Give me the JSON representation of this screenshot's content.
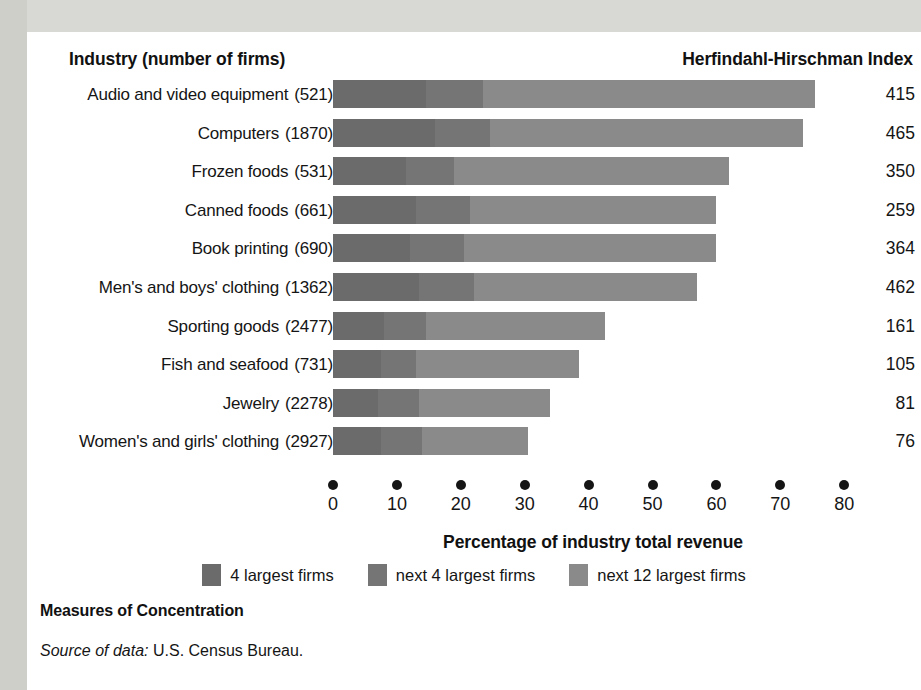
{
  "headers": {
    "industry": "Industry (number of firms)",
    "hhi": "Herfindahl-Hirschman Index"
  },
  "axis_title": "Percentage of industry total revenue",
  "figure_caption": "Measures of Concentration",
  "source": {
    "label": "Source of data:",
    "text": "U.S. Census Bureau."
  },
  "legend": [
    {
      "key": "s1",
      "label": "4 largest firms",
      "color": "#6b6b6b"
    },
    {
      "key": "s2",
      "label": "next 4 largest firms",
      "color": "#757575"
    },
    {
      "key": "s3",
      "label": "next 12 largest firms",
      "color": "#8a8a8a"
    }
  ],
  "ticks": [
    {
      "label": "0",
      "value": 0
    },
    {
      "label": "10",
      "value": 10
    },
    {
      "label": "20",
      "value": 20
    },
    {
      "label": "30",
      "value": 30
    },
    {
      "label": "40",
      "value": 40
    },
    {
      "label": "50",
      "value": 50
    },
    {
      "label": "60",
      "value": 60
    },
    {
      "label": "70",
      "value": 70
    },
    {
      "label": "80",
      "value": 80
    }
  ],
  "chart_data": {
    "type": "bar",
    "orientation": "horizontal",
    "stacked": true,
    "title": "Measures of Concentration",
    "xlabel": "Percentage of industry total revenue",
    "ylabel": "Industry (number of firms)",
    "xlim": [
      0,
      80
    ],
    "grid": false,
    "legend_position": "bottom-center",
    "series": [
      {
        "name": "4 largest firms",
        "color": "#6b6b6b",
        "values": [
          14.5,
          16.0,
          11.5,
          13.0,
          12.0,
          13.5,
          8.0,
          7.5,
          7.0,
          7.5
        ]
      },
      {
        "name": "next 4 largest firms",
        "color": "#757575",
        "values": [
          9.0,
          8.5,
          7.5,
          8.5,
          8.5,
          8.5,
          6.5,
          5.5,
          6.5,
          6.5
        ]
      },
      {
        "name": "next 12 largest firms",
        "color": "#8a8a8a",
        "values": [
          52.0,
          49.0,
          43.0,
          38.5,
          39.5,
          35.0,
          28.0,
          25.5,
          20.5,
          16.5
        ]
      }
    ],
    "categories": [
      "Audio and video equipment",
      "Computers",
      "Frozen foods",
      "Canned foods",
      "Book printing",
      "Men's and boys' clothing",
      "Sporting goods",
      "Fish and seafood",
      "Jewelry",
      "Women's and girls' clothing"
    ],
    "rows": [
      {
        "industry": "Audio and video equipment",
        "firms": "(521)",
        "seg1": 14.5,
        "seg2": 9.0,
        "seg3": 52.0,
        "total": 75.5,
        "hhi": "415"
      },
      {
        "industry": "Computers",
        "firms": "(1870)",
        "seg1": 16.0,
        "seg2": 8.5,
        "seg3": 49.0,
        "total": 73.5,
        "hhi": "465"
      },
      {
        "industry": "Frozen foods",
        "firms": "(531)",
        "seg1": 11.5,
        "seg2": 7.5,
        "seg3": 43.0,
        "total": 62.0,
        "hhi": "350"
      },
      {
        "industry": "Canned foods",
        "firms": "(661)",
        "seg1": 13.0,
        "seg2": 8.5,
        "seg3": 38.5,
        "total": 60.0,
        "hhi": "259"
      },
      {
        "industry": "Book printing",
        "firms": "(690)",
        "seg1": 12.0,
        "seg2": 8.5,
        "seg3": 39.5,
        "total": 60.0,
        "hhi": "364"
      },
      {
        "industry": "Men's and boys' clothing",
        "firms": "(1362)",
        "seg1": 13.5,
        "seg2": 8.5,
        "seg3": 35.0,
        "total": 57.0,
        "hhi": "462"
      },
      {
        "industry": "Sporting goods",
        "firms": "(2477)",
        "seg1": 8.0,
        "seg2": 6.5,
        "seg3": 28.0,
        "total": 42.5,
        "hhi": "161"
      },
      {
        "industry": "Fish and seafood",
        "firms": "(731)",
        "seg1": 7.5,
        "seg2": 5.5,
        "seg3": 25.5,
        "total": 38.5,
        "hhi": "105"
      },
      {
        "industry": "Jewelry",
        "firms": "(2278)",
        "seg1": 7.0,
        "seg2": 6.5,
        "seg3": 20.5,
        "total": 34.0,
        "hhi": "81"
      },
      {
        "industry": "Women's and girls' clothing",
        "firms": "(2927)",
        "seg1": 7.5,
        "seg2": 6.5,
        "seg3": 16.5,
        "total": 30.5,
        "hhi": "76"
      }
    ]
  }
}
